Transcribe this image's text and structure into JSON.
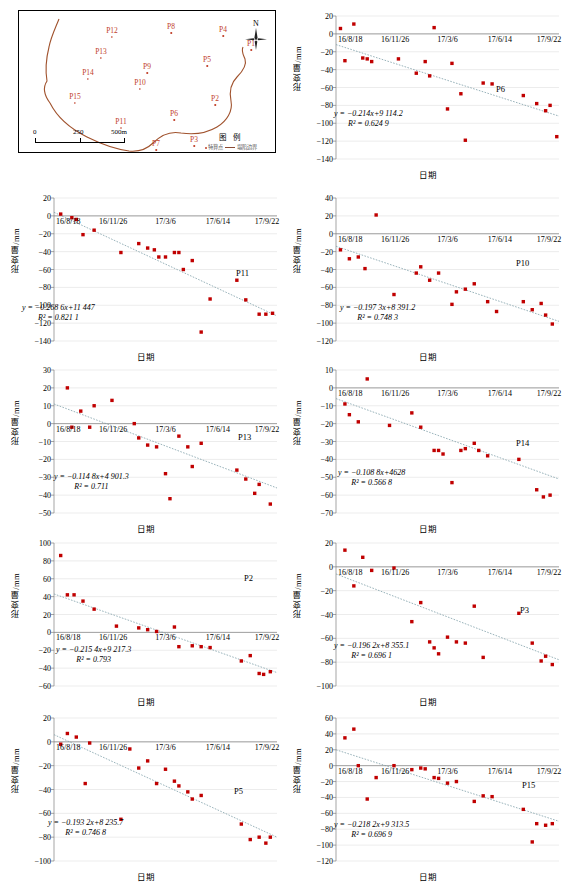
{
  "map": {
    "title_legend": "图 例",
    "legend_point_label": "特算点",
    "legend_line_label": "塌陷边界",
    "compass_label": "N",
    "scale_ticks": [
      "0",
      "250",
      "500m"
    ],
    "points": [
      {
        "id": "P12",
        "x": 93,
        "y": 16
      },
      {
        "id": "P8",
        "x": 152,
        "y": 12
      },
      {
        "id": "P4",
        "x": 204,
        "y": 15
      },
      {
        "id": "P1",
        "x": 232,
        "y": 29
      },
      {
        "id": "P13",
        "x": 82,
        "y": 37
      },
      {
        "id": "P5",
        "x": 188,
        "y": 45
      },
      {
        "id": "P9",
        "x": 128,
        "y": 52
      },
      {
        "id": "P14",
        "x": 69,
        "y": 58
      },
      {
        "id": "P10",
        "x": 121,
        "y": 68
      },
      {
        "id": "P15",
        "x": 56,
        "y": 82
      },
      {
        "id": "P2",
        "x": 196,
        "y": 84
      },
      {
        "id": "P6",
        "x": 155,
        "y": 99
      },
      {
        "id": "P11",
        "x": 102,
        "y": 107
      },
      {
        "id": "P3",
        "x": 175,
        "y": 125
      },
      {
        "id": "P7",
        "x": 137,
        "y": 135
      }
    ]
  },
  "common": {
    "ylabel": "形变量/mm",
    "xlabel": "日期",
    "xticks": [
      "16/8/18",
      "16/11/26",
      "17/3/6",
      "17/6/14",
      "17/9/22"
    ],
    "marker_color": "#c00000",
    "trend_color": "#7f9fa8"
  },
  "chart_data": [
    {
      "type": "scatter",
      "name": "P6",
      "title": "P6",
      "xlabel": "日期",
      "ylabel": "形变量/mm",
      "equation": "y = −0.214x+9 114.2",
      "r2": "R² = 0.624 9",
      "slope": -0.214,
      "intercept": 9114.2,
      "r2_value": 0.6249,
      "ylim": [
        -140,
        20
      ],
      "yticks": [
        20,
        0,
        -20,
        -40,
        -60,
        -80,
        -100,
        -120,
        -140
      ],
      "xticks": [
        "16/8/18",
        "16/11/26",
        "17/3/6",
        "17/6/14",
        "17/9/22"
      ],
      "xlim": [
        0,
        100
      ],
      "trend": [
        [
          0,
          -12
        ],
        [
          100,
          -92
        ]
      ],
      "points": [
        [
          2,
          6
        ],
        [
          8,
          11
        ],
        [
          4,
          -30
        ],
        [
          12,
          -27
        ],
        [
          14,
          -28
        ],
        [
          16,
          -31
        ],
        [
          28,
          -28
        ],
        [
          36,
          -44
        ],
        [
          42,
          -47
        ],
        [
          40,
          -31
        ],
        [
          44,
          7
        ],
        [
          52,
          -33
        ],
        [
          50,
          -84
        ],
        [
          56,
          -67
        ],
        [
          58,
          -119
        ],
        [
          66,
          -55
        ],
        [
          70,
          -56
        ],
        [
          84,
          -69
        ],
        [
          90,
          -78
        ],
        [
          94,
          -86
        ],
        [
          96,
          -80
        ],
        [
          99,
          -115
        ]
      ]
    },
    {
      "type": "scatter",
      "name": "P11",
      "title": "P11",
      "xlabel": "日期",
      "ylabel": "形变量/mm",
      "equation": "y = −0.268 6x+11 447",
      "r2": "R² = 0.821 1",
      "slope": -0.2686,
      "intercept": 11447,
      "r2_value": 0.8211,
      "ylim": [
        -140,
        20
      ],
      "yticks": [
        20,
        0,
        -20,
        -40,
        -60,
        -80,
        -100,
        -120,
        -140
      ],
      "xticks": [
        "16/8/18",
        "16/11/26",
        "17/3/6",
        "17/6/14",
        "17/9/22"
      ],
      "xlim": [
        0,
        100
      ],
      "trend": [
        [
          0,
          4
        ],
        [
          100,
          -112
        ]
      ],
      "points": [
        [
          3,
          2
        ],
        [
          8,
          -2
        ],
        [
          10,
          -4
        ],
        [
          13,
          -21
        ],
        [
          18,
          -16
        ],
        [
          30,
          -41
        ],
        [
          38,
          -31
        ],
        [
          42,
          -36
        ],
        [
          45,
          -38
        ],
        [
          47,
          -46
        ],
        [
          50,
          -46
        ],
        [
          54,
          -41
        ],
        [
          56,
          -41
        ],
        [
          58,
          -60
        ],
        [
          62,
          -50
        ],
        [
          66,
          -130
        ],
        [
          70,
          -93
        ],
        [
          82,
          -72
        ],
        [
          86,
          -94
        ],
        [
          92,
          -110
        ],
        [
          95,
          -110
        ],
        [
          98,
          -109
        ]
      ]
    },
    {
      "type": "scatter",
      "name": "P10",
      "title": "P10",
      "xlabel": "日期",
      "ylabel": "形变量/mm",
      "equation": "y = −0.197 3x+8 391.2",
      "r2": "R² = 0.748 3",
      "slope": -0.1973,
      "intercept": 8391.2,
      "r2_value": 0.7483,
      "ylim": [
        -120,
        40
      ],
      "yticks": [
        40,
        20,
        0,
        -20,
        -40,
        -60,
        -80,
        -100,
        -120
      ],
      "xticks": [
        "16/8/18",
        "16/11/26",
        "17/3/6",
        "17/6/14",
        "17/9/22"
      ],
      "xlim": [
        0,
        100
      ],
      "trend": [
        [
          0,
          -14
        ],
        [
          100,
          -98
        ]
      ],
      "points": [
        [
          2,
          -18
        ],
        [
          6,
          -28
        ],
        [
          10,
          -26
        ],
        [
          13,
          -39
        ],
        [
          18,
          21
        ],
        [
          26,
          -68
        ],
        [
          36,
          -44
        ],
        [
          38,
          -37
        ],
        [
          42,
          -52
        ],
        [
          46,
          -44
        ],
        [
          52,
          -79
        ],
        [
          54,
          -65
        ],
        [
          58,
          -62
        ],
        [
          62,
          -56
        ],
        [
          68,
          -76
        ],
        [
          72,
          -87
        ],
        [
          84,
          -76
        ],
        [
          88,
          -85
        ],
        [
          92,
          -78
        ],
        [
          94,
          -91
        ],
        [
          97,
          -101
        ]
      ]
    },
    {
      "type": "scatter",
      "name": "P13",
      "title": "P13",
      "xlabel": "日期",
      "ylabel": "形变量/mm",
      "equation": "y = −0.114 8x+4 901.3",
      "r2": "R² = 0.711",
      "slope": -0.1148,
      "intercept": 4901.3,
      "r2_value": 0.711,
      "ylim": [
        -50,
        30
      ],
      "yticks": [
        30,
        20,
        10,
        0,
        -10,
        -20,
        -30,
        -40,
        -50
      ],
      "xticks": [
        "16/8/18",
        "16/11/26",
        "17/3/6",
        "17/6/14",
        "17/9/22"
      ],
      "xlim": [
        0,
        100
      ],
      "trend": [
        [
          0,
          11
        ],
        [
          100,
          -36
        ]
      ],
      "points": [
        [
          6,
          20
        ],
        [
          8,
          -2
        ],
        [
          12,
          7
        ],
        [
          16,
          -2
        ],
        [
          18,
          10
        ],
        [
          26,
          13
        ],
        [
          36,
          0
        ],
        [
          38,
          -8
        ],
        [
          42,
          -12
        ],
        [
          46,
          -13
        ],
        [
          50,
          -28
        ],
        [
          52,
          -42
        ],
        [
          56,
          -7
        ],
        [
          60,
          -13
        ],
        [
          62,
          -24
        ],
        [
          66,
          -11
        ],
        [
          82,
          -26
        ],
        [
          86,
          -31
        ],
        [
          90,
          -39
        ],
        [
          92,
          -34
        ],
        [
          97,
          -45
        ]
      ]
    },
    {
      "type": "scatter",
      "name": "P14",
      "title": "P14",
      "xlabel": "日期",
      "ylabel": "形变量/mm",
      "equation": "y = −0.108 8x+4628",
      "r2": "R² = 0.566 8",
      "slope": -0.1088,
      "intercept": 4628,
      "r2_value": 0.5668,
      "ylim": [
        -70,
        10
      ],
      "yticks": [
        10,
        0,
        -10,
        -20,
        -30,
        -40,
        -50,
        -60,
        -70
      ],
      "xticks": [
        "16/8/18",
        "16/11/26",
        "17/3/6",
        "17/6/14",
        "17/9/22"
      ],
      "xlim": [
        0,
        100
      ],
      "trend": [
        [
          0,
          -6
        ],
        [
          100,
          -51
        ]
      ],
      "points": [
        [
          4,
          -9
        ],
        [
          6,
          -15
        ],
        [
          10,
          -19
        ],
        [
          14,
          5
        ],
        [
          24,
          -21
        ],
        [
          34,
          -14
        ],
        [
          38,
          -22
        ],
        [
          44,
          -35
        ],
        [
          46,
          -35
        ],
        [
          48,
          -37
        ],
        [
          52,
          -53
        ],
        [
          56,
          -35
        ],
        [
          58,
          -34
        ],
        [
          62,
          -31
        ],
        [
          64,
          -35
        ],
        [
          68,
          -38
        ],
        [
          82,
          -40
        ],
        [
          90,
          -57
        ],
        [
          93,
          -61
        ],
        [
          96,
          -60
        ]
      ]
    },
    {
      "type": "scatter",
      "name": "P2",
      "title": "P2",
      "xlabel": "日期",
      "ylabel": "形变量/mm",
      "equation": "y = −0.215 4x+9 217.3",
      "r2": "R² = 0.793",
      "slope": -0.2154,
      "intercept": 9217.3,
      "r2_value": 0.793,
      "ylim": [
        -60,
        100
      ],
      "yticks": [
        100,
        80,
        60,
        40,
        20,
        0,
        -20,
        -40,
        -60
      ],
      "xticks": [
        "16/8/18",
        "16/11/26",
        "17/3/6",
        "17/6/14",
        "17/9/22"
      ],
      "xlim": [
        0,
        100
      ],
      "trend": [
        [
          0,
          43
        ],
        [
          100,
          -45
        ]
      ],
      "points": [
        [
          3,
          86
        ],
        [
          6,
          42
        ],
        [
          9,
          42
        ],
        [
          13,
          35
        ],
        [
          18,
          26
        ],
        [
          28,
          7
        ],
        [
          38,
          5
        ],
        [
          42,
          3
        ],
        [
          46,
          1
        ],
        [
          54,
          6
        ],
        [
          56,
          -16
        ],
        [
          62,
          -15
        ],
        [
          66,
          -16
        ],
        [
          70,
          -17
        ],
        [
          84,
          -32
        ],
        [
          88,
          -26
        ],
        [
          92,
          -46
        ],
        [
          94,
          -47
        ],
        [
          97,
          -44
        ]
      ]
    },
    {
      "type": "scatter",
      "name": "P3",
      "title": "P3",
      "xlabel": "日期",
      "ylabel": "形变量/mm",
      "equation": "y = −0.196 2x+8 355.1",
      "r2": "R² = 0.696 1",
      "slope": -0.1962,
      "intercept": 8355.1,
      "r2_value": 0.6961,
      "ylim": [
        -100,
        20
      ],
      "yticks": [
        20,
        0,
        -20,
        -40,
        -60,
        -80,
        -100
      ],
      "xticks": [
        "16/8/18",
        "16/11/26",
        "17/3/6",
        "17/6/14",
        "17/9/22"
      ],
      "xlim": [
        0,
        100
      ],
      "trend": [
        [
          0,
          -6
        ],
        [
          100,
          -78
        ]
      ],
      "points": [
        [
          4,
          14
        ],
        [
          8,
          -16
        ],
        [
          12,
          8
        ],
        [
          16,
          -3
        ],
        [
          26,
          -1
        ],
        [
          34,
          -46
        ],
        [
          38,
          -30
        ],
        [
          42,
          -63
        ],
        [
          44,
          -68
        ],
        [
          46,
          -73
        ],
        [
          50,
          -59
        ],
        [
          54,
          -63
        ],
        [
          58,
          -64
        ],
        [
          62,
          -33
        ],
        [
          66,
          -76
        ],
        [
          82,
          -39
        ],
        [
          88,
          -64
        ],
        [
          92,
          -79
        ],
        [
          94,
          -75
        ],
        [
          97,
          -82
        ]
      ]
    },
    {
      "type": "scatter",
      "name": "P5",
      "title": "P5",
      "xlabel": "日期",
      "ylabel": "形变量/mm",
      "equation": "y = −0.193 2x+8 235.7",
      "r2": "R² = 0.746 8",
      "slope": -0.1932,
      "intercept": 8235.7,
      "r2_value": 0.7468,
      "ylim": [
        -100,
        20
      ],
      "yticks": [
        20,
        0,
        -20,
        -40,
        -60,
        -80,
        -100
      ],
      "xticks": [
        "16/8/18",
        "16/11/26",
        "17/3/6",
        "17/6/14",
        "17/9/22"
      ],
      "xlim": [
        0,
        100
      ],
      "trend": [
        [
          0,
          6
        ],
        [
          100,
          -80
        ]
      ],
      "points": [
        [
          3,
          -2
        ],
        [
          6,
          7
        ],
        [
          10,
          4
        ],
        [
          14,
          -35
        ],
        [
          16,
          -1
        ],
        [
          30,
          -65
        ],
        [
          34,
          -6
        ],
        [
          38,
          -22
        ],
        [
          42,
          -16
        ],
        [
          46,
          -35
        ],
        [
          50,
          -23
        ],
        [
          54,
          -33
        ],
        [
          56,
          -37
        ],
        [
          60,
          -42
        ],
        [
          62,
          -48
        ],
        [
          66,
          -45
        ],
        [
          84,
          -69
        ],
        [
          88,
          -82
        ],
        [
          92,
          -80
        ],
        [
          95,
          -85
        ],
        [
          97,
          -80
        ]
      ]
    },
    {
      "type": "scatter",
      "name": "P15",
      "title": "P15",
      "xlabel": "日期",
      "ylabel": "形变量/mm",
      "equation": "y = −0.218 2x+9 313.5",
      "r2": "R² = 0.696 9",
      "slope": -0.2182,
      "intercept": 9313.5,
      "r2_value": 0.6969,
      "ylim": [
        -120,
        60
      ],
      "yticks": [
        60,
        40,
        20,
        0,
        -20,
        -40,
        -60,
        -80,
        -100,
        -120
      ],
      "xticks": [
        "16/8/18",
        "16/11/26",
        "17/3/6",
        "17/6/14",
        "17/9/22"
      ],
      "xlim": [
        0,
        100
      ],
      "trend": [
        [
          0,
          20
        ],
        [
          100,
          -70
        ]
      ],
      "points": [
        [
          4,
          35
        ],
        [
          8,
          46
        ],
        [
          10,
          0
        ],
        [
          14,
          -42
        ],
        [
          18,
          -15
        ],
        [
          26,
          0
        ],
        [
          34,
          -5
        ],
        [
          38,
          -3
        ],
        [
          40,
          -4
        ],
        [
          44,
          -15
        ],
        [
          46,
          -16
        ],
        [
          50,
          -22
        ],
        [
          54,
          -20
        ],
        [
          62,
          -45
        ],
        [
          66,
          -38
        ],
        [
          70,
          -39
        ],
        [
          84,
          -55
        ],
        [
          88,
          -96
        ],
        [
          90,
          -73
        ],
        [
          94,
          -75
        ],
        [
          97,
          -73
        ]
      ]
    }
  ]
}
